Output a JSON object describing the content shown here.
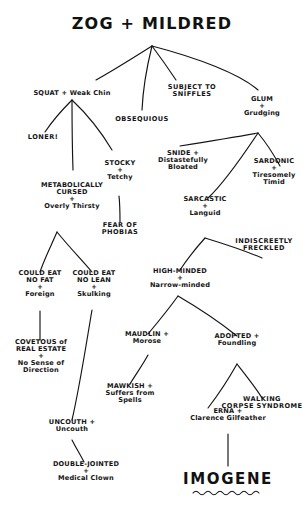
{
  "diagram": {
    "title": "ZOG + MILDRED",
    "final_name": "IMOGENE",
    "ink_color": "#141414",
    "paper_color": "#ffffff",
    "type": "hand-drawn-family-tree",
    "nodes": {
      "root": "ZOG + MILDRED",
      "squat": "SQUAT + Weak Chin",
      "obsequious": "OBSEQUIOUS",
      "subject_to_sniffles": "SUBJECT TO\nSNIFFLES",
      "glum": "GLUM\n+\nGrudging",
      "loner": "LONER!",
      "metabolically_cursed": "METABOLICALLY\nCURSED\n+\nOverly Thirsty",
      "stocky": "STOCKY\n+\nTetchy",
      "fear_of_phobias": "FEAR OF\nPHOBIAS",
      "snide": "SNIDE +\nDistastefully\nBloated",
      "sardonic": "SARDONIC\n+\nTiresomely\nTimid",
      "sarcastic": "SARCASTIC\n+\nLanguid",
      "indiscreetly_freckled": "INDISCREETLY\nFRECKLED",
      "could_eat_no_fat": "COULD EAT\nNO FAT\n+\nForeign",
      "could_eat_no_lean": "COULD EAT\nNO LEAN\n+\nSkulking",
      "high_minded": "HIGH-MINDED\n+\nNarrow-minded",
      "covetous": "COVETOUS of\nREAL ESTATE\n+\nNo Sense of\nDirection",
      "maudlin": "MAUDLIN +\nMorose",
      "mawkish": "MAWKISH +\nSuffers from\nSpells",
      "adopted": "ADOPTED +\nFoundling",
      "walking_corpse": "WALKING\nCORPSE SYNDROME",
      "uncouth": "UNCOUTH +\nUncouth",
      "double_jointed": "DOUBLE-JOINTED\n+\nMedical Clown",
      "erna": "ERNA +\nClarence Gilfeather",
      "imogene": "IMOGENE"
    }
  }
}
